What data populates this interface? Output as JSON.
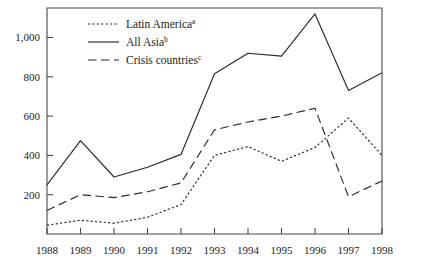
{
  "chart_data": {
    "type": "line",
    "title": "",
    "subtitle": "",
    "xlabel": "",
    "ylabel": "",
    "categories": [
      "1988",
      "1989",
      "1990",
      "1991",
      "1992",
      "1993",
      "1994",
      "1995",
      "1996",
      "1997",
      "1998"
    ],
    "x": [
      1988,
      1989,
      1990,
      1991,
      1992,
      1993,
      1994,
      1995,
      1996,
      1997,
      1998
    ],
    "xlim": [
      1988,
      1998
    ],
    "ylim": [
      0,
      1150
    ],
    "yticks": [
      200,
      400,
      600,
      800,
      1000
    ],
    "ytick_labels": [
      "200",
      "400",
      "600",
      "800",
      "1,000"
    ],
    "grid": false,
    "legend_position": "top-left",
    "series": [
      {
        "name": "Latin America",
        "footnote": "a",
        "style": "dotted",
        "values": [
          45,
          70,
          55,
          85,
          150,
          400,
          445,
          370,
          440,
          590,
          400
        ]
      },
      {
        "name": "All Asia",
        "footnote": "b",
        "style": "solid",
        "values": [
          250,
          475,
          290,
          340,
          405,
          815,
          920,
          905,
          1120,
          730,
          820
        ]
      },
      {
        "name": "Crisis countries",
        "footnote": "c",
        "style": "dashed",
        "values": [
          120,
          200,
          185,
          215,
          260,
          530,
          570,
          600,
          640,
          190,
          270
        ]
      }
    ]
  },
  "legend": {
    "entries": [
      {
        "label": "Latin America",
        "sup": "a",
        "icon": "dotted-line-swatch"
      },
      {
        "label": "All Asia",
        "sup": "b",
        "icon": "solid-line-swatch"
      },
      {
        "label": "Crisis countries",
        "sup": "c",
        "icon": "dashed-line-swatch"
      }
    ]
  }
}
